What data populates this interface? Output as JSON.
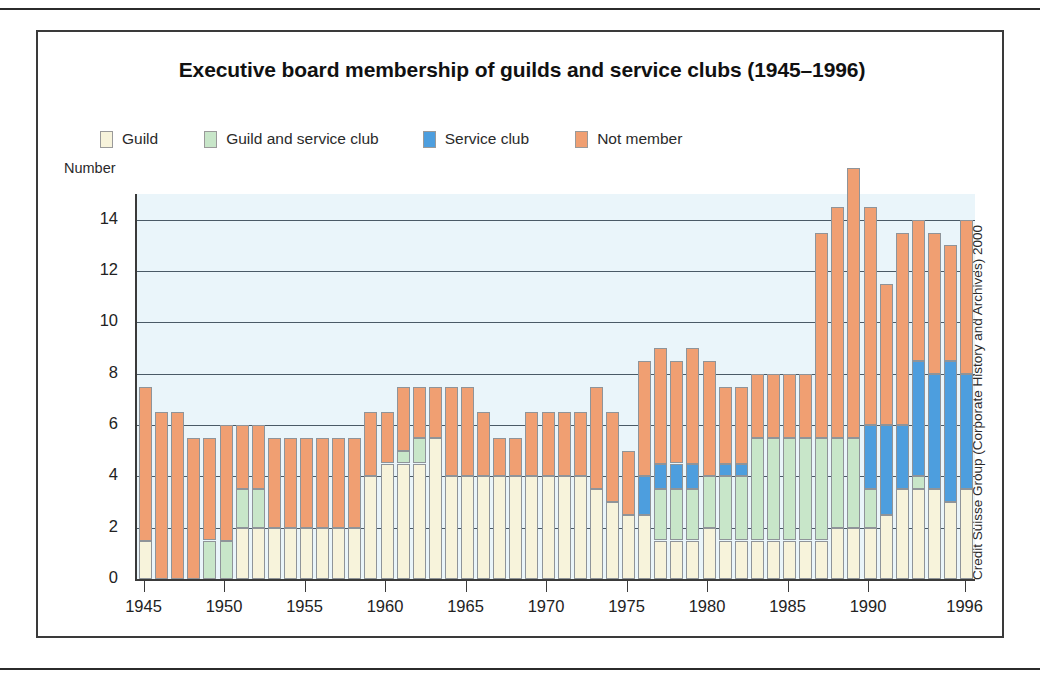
{
  "figure": {
    "title": "Executive board membership of guilds and service clubs (1945–1996)",
    "axis_unit_label": "Number",
    "credit": "Credit Suisse Group (Corporate History and Archives) 2000"
  },
  "colors": {
    "guild": "#f7f3db",
    "guild_and_service_club": "#c8e6c9",
    "service_club": "#4d9ede",
    "not_member": "#f09f72",
    "plot_background": "#eaf5fa",
    "gridline": "#4a5a66",
    "axis": "#3a3a3a"
  },
  "chart_data": {
    "type": "bar",
    "subtype": "stacked-vertical",
    "title": "Executive board membership of guilds and service clubs (1945–1996)",
    "xlabel": "",
    "ylabel": "Number",
    "ylim": [
      0,
      15
    ],
    "yticks": [
      0,
      2,
      4,
      6,
      8,
      10,
      12,
      14
    ],
    "xticks": [
      1945,
      1950,
      1955,
      1960,
      1965,
      1970,
      1975,
      1980,
      1985,
      1990,
      1996
    ],
    "grid": true,
    "legend_position": "top",
    "legend": [
      "Guild",
      "Guild and service club",
      "Service club",
      "Not member"
    ],
    "categories": [
      1945,
      1946,
      1947,
      1948,
      1949,
      1950,
      1951,
      1952,
      1953,
      1954,
      1955,
      1956,
      1957,
      1958,
      1959,
      1960,
      1961,
      1962,
      1963,
      1964,
      1965,
      1966,
      1967,
      1968,
      1969,
      1970,
      1971,
      1972,
      1973,
      1974,
      1975,
      1976,
      1977,
      1978,
      1979,
      1980,
      1981,
      1982,
      1983,
      1984,
      1985,
      1986,
      1987,
      1988,
      1989,
      1990,
      1991,
      1992,
      1993,
      1994,
      1995,
      1996
    ],
    "series": [
      {
        "name": "Guild",
        "color": "#f7f3db",
        "values": [
          1.5,
          0,
          0,
          0,
          0,
          0,
          2,
          2,
          2,
          2,
          2,
          2,
          2,
          2,
          4,
          4.5,
          4.5,
          4.5,
          5.5,
          4,
          4,
          4,
          4,
          4,
          4,
          4,
          4,
          4,
          3.5,
          3,
          2.5,
          2.5,
          1.5,
          1.5,
          1.5,
          2,
          1.5,
          1.5,
          1.5,
          1.5,
          1.5,
          1.5,
          1.5,
          2,
          2,
          2,
          2.5,
          3.5,
          3.5,
          3.5,
          3,
          3.5
        ]
      },
      {
        "name": "Guild and service club",
        "color": "#c8e6c9",
        "values": [
          0,
          0,
          0,
          0,
          1.5,
          1.5,
          1.5,
          1.5,
          0,
          0,
          0,
          0,
          0,
          0,
          0,
          0,
          0.5,
          1,
          0,
          0,
          0,
          0,
          0,
          0,
          0,
          0,
          0,
          0,
          0,
          0,
          0,
          0,
          2,
          2,
          2,
          2,
          2.5,
          2.5,
          4,
          4,
          4,
          4,
          4,
          3.5,
          3.5,
          1.5,
          0,
          0,
          0.5,
          0,
          0,
          0
        ]
      },
      {
        "name": "Service club",
        "color": "#4d9ede",
        "values": [
          0,
          0,
          0,
          0,
          0,
          0,
          0,
          0,
          0,
          0,
          0,
          0,
          0,
          0,
          0,
          0,
          0,
          0,
          0,
          0,
          0,
          0,
          0,
          0,
          0,
          0,
          0,
          0,
          0,
          0,
          0,
          1.5,
          1,
          1,
          1,
          0,
          0.5,
          0.5,
          0,
          0,
          0,
          0,
          0,
          0,
          0,
          2.5,
          3.5,
          2.5,
          4.5,
          4.5,
          5.5,
          4.5
        ]
      },
      {
        "name": "Not member",
        "color": "#f09f72",
        "values": [
          6,
          6.5,
          6.5,
          5.5,
          4,
          4.5,
          2.5,
          2.5,
          3.5,
          3.5,
          3.5,
          3.5,
          3.5,
          3.5,
          2.5,
          2,
          2.5,
          2,
          2,
          3.5,
          3.5,
          2.5,
          1.5,
          1.5,
          2.5,
          2.5,
          2.5,
          2.5,
          4,
          3.5,
          2.5,
          4.5,
          4.5,
          4,
          4.5,
          4.5,
          3,
          3,
          2.5,
          2.5,
          2.5,
          2.5,
          8,
          9,
          10.5,
          8.5,
          5.5,
          7.5,
          5.5,
          5.5,
          4.5,
          6
        ]
      }
    ],
    "totals": [
      7.5,
      6.5,
      6.5,
      5.5,
      5.5,
      6,
      6,
      6,
      5.5,
      5.5,
      5.5,
      5.5,
      5.5,
      5.5,
      6.5,
      6.5,
      7.5,
      7.5,
      7.5,
      7.5,
      7.5,
      6.5,
      5.5,
      5.5,
      6.5,
      6.5,
      6.5,
      6.5,
      7.5,
      6.5,
      5,
      8.5,
      9,
      8.5,
      9,
      8.5,
      7.5,
      7.5,
      8,
      8,
      8,
      8,
      13.5,
      14.5,
      16,
      14.5,
      11.5,
      13.5,
      14,
      13.5,
      14,
      14
    ]
  }
}
